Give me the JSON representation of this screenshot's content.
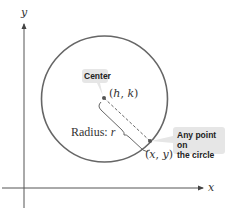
{
  "diagram": {
    "type": "circle-standard-form",
    "axes": {
      "x_label": "x",
      "y_label": "y"
    },
    "circle": {
      "center_label_h": "h",
      "center_label_k": "k",
      "center_callout": "Center",
      "point_label_x": "x",
      "point_label_y": "y",
      "point_callout_line1": "Any point on",
      "point_callout_line2": "the circle",
      "radius_label_prefix": "Radius: ",
      "radius_label_var": "r"
    },
    "colors": {
      "circle_stroke": "#666666",
      "axis_stroke": "#555555",
      "callout_bg": "#e6e6e6",
      "text": "#333333"
    }
  }
}
